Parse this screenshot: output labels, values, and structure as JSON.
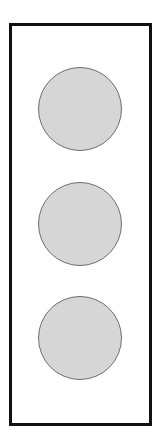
{
  "diagram": {
    "frame": {
      "border_color": "#111111",
      "fill": "#ffffff"
    },
    "circles": [
      {
        "id": 1,
        "fill": "#d6d6d6",
        "stroke": "#6e6e6e"
      },
      {
        "id": 2,
        "fill": "#d6d6d6",
        "stroke": "#6e6e6e"
      },
      {
        "id": 3,
        "fill": "#d6d6d6",
        "stroke": "#6e6e6e"
      }
    ]
  }
}
